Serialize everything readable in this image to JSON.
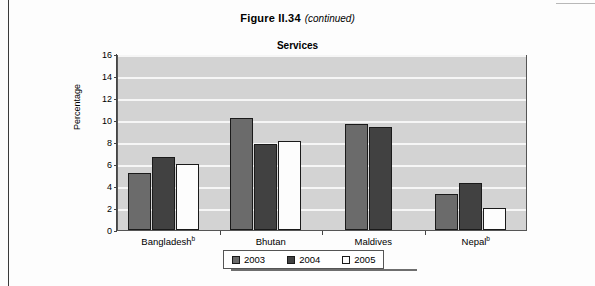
{
  "figure": {
    "number": "Figure  II.34",
    "continued": "(continued)"
  },
  "chart_data": {
    "type": "bar",
    "title": "Services",
    "xlabel": "",
    "ylabel": "Percentage",
    "ylim": [
      0,
      16
    ],
    "ytick_step": 2,
    "yticks": [
      "16",
      "14",
      "12",
      "10",
      "8",
      "6",
      "4",
      "2",
      "0"
    ],
    "grid": true,
    "grid_color": "#f6f6f6",
    "plot_background": "#d3d3d3",
    "legend_position": "bottom-center",
    "categories": [
      "Bangladesh",
      "Bhutan",
      "Maldives",
      "Nepal"
    ],
    "category_labels": [
      {
        "name": "Bangladesh",
        "note": "b"
      },
      {
        "name": "Bhutan",
        "note": ""
      },
      {
        "name": "Maldives",
        "note": ""
      },
      {
        "name": "Nepal",
        "note": "b"
      }
    ],
    "series": [
      {
        "name": "2003",
        "color": "#6b6b6b",
        "values": [
          5.2,
          10.2,
          9.6,
          3.3
        ]
      },
      {
        "name": "2004",
        "color": "#414141",
        "values": [
          6.6,
          7.8,
          9.4,
          4.3
        ]
      },
      {
        "name": "2005",
        "color": "#fdfdfd",
        "values": [
          6.0,
          8.1,
          null,
          2.0
        ]
      }
    ]
  },
  "legend": {
    "items": [
      {
        "label": "2003",
        "color": "#6b6b6b"
      },
      {
        "label": "2004",
        "color": "#414141"
      },
      {
        "label": "2005",
        "color": "#fdfdfd"
      }
    ]
  },
  "source_note": ""
}
